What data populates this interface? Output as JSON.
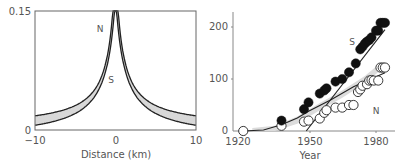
{
  "chart_data": [
    {
      "type": "line",
      "title": "",
      "xlabel": "Distance (km)",
      "ylabel": "",
      "xlim": [
        -10,
        10
      ],
      "ylim": [
        0,
        0.15
      ],
      "x_ticks": [
        "−10",
        "0",
        "10"
      ],
      "y_ticks": [
        "0",
        "0.15"
      ],
      "grid": false,
      "annotations": [
        {
          "text": "N",
          "x": -1.6,
          "y": 0.133
        },
        {
          "text": "S",
          "x": -1.4,
          "y": 0.075
        }
      ],
      "series": [
        {
          "name": "N",
          "description": "upper band edge, peaked curve centered at 0",
          "x": [
            -10,
            -7.5,
            -5,
            -3,
            -2,
            -1,
            -0.5,
            0,
            0.5,
            1,
            2,
            3,
            5,
            7.5,
            10
          ],
          "values": [
            0.015,
            0.024,
            0.037,
            0.058,
            0.075,
            0.105,
            0.13,
            0.15,
            0.13,
            0.105,
            0.075,
            0.058,
            0.037,
            0.024,
            0.015
          ]
        },
        {
          "name": "S",
          "description": "lower band edge, peaked curve centered at 0",
          "x": [
            -10,
            -7.5,
            -5,
            -3,
            -2,
            -1,
            -0.5,
            0,
            0.5,
            1,
            2,
            3,
            5,
            7.5,
            10
          ],
          "values": [
            0.007,
            0.015,
            0.03,
            0.052,
            0.072,
            0.105,
            0.13,
            0.15,
            0.13,
            0.105,
            0.072,
            0.052,
            0.03,
            0.015,
            0.007
          ]
        }
      ],
      "shaded_band": "grey band between N and S curves"
    },
    {
      "type": "scatter",
      "title": "",
      "xlabel": "Year",
      "ylabel": "",
      "xlim": [
        1912,
        1989
      ],
      "ylim": [
        0,
        230
      ],
      "x_ticks": [
        "1920",
        "1950",
        "1980"
      ],
      "y_ticks": [
        "0",
        "100",
        "200"
      ],
      "grid": false,
      "annotations": [
        {
          "text": "S",
          "x": 1964,
          "y": 152
        },
        {
          "text": "N",
          "x": 1979,
          "y": 40
        }
      ],
      "series": [
        {
          "name": "S",
          "marker": "filled-circle",
          "x": [
            1938,
            1948,
            1950,
            1955,
            1957,
            1958,
            1962,
            1965,
            1968,
            1971,
            1973,
            1974,
            1975,
            1976,
            1977,
            1978,
            1980,
            1981,
            1982,
            1983,
            1984
          ],
          "values": [
            20,
            42,
            55,
            72,
            78,
            82,
            95,
            100,
            113,
            130,
            157,
            162,
            168,
            172,
            175,
            180,
            193,
            193,
            208,
            208,
            208
          ]
        },
        {
          "name": "N",
          "marker": "open-circle",
          "x": [
            1921,
            1938,
            1948,
            1950,
            1955,
            1957,
            1958,
            1962,
            1965,
            1968,
            1970,
            1972,
            1973,
            1974,
            1976,
            1977,
            1978,
            1979,
            1981,
            1982,
            1983,
            1984
          ],
          "values": [
            0,
            10,
            18,
            20,
            24,
            35,
            40,
            45,
            45,
            50,
            50,
            75,
            80,
            87,
            90,
            97,
            98,
            97,
            97,
            122,
            122,
            122
          ]
        },
        {
          "name": "S-fit",
          "marker": "line",
          "x": [
            1949,
            1984
          ],
          "values": [
            0,
            195
          ]
        },
        {
          "name": "N-fit",
          "marker": "line",
          "x": [
            1921,
            1930,
            1938,
            1945,
            1950,
            1960,
            1970,
            1984
          ],
          "values": [
            0,
            2,
            12,
            25,
            38,
            60,
            85,
            112
          ]
        },
        {
          "name": "model-band",
          "marker": "shaded-band",
          "x": [
            1925,
            1935,
            1945,
            1955,
            1965,
            1975,
            1982
          ],
          "values": [
            0,
            4,
            22,
            48,
            72,
            100,
            125
          ]
        }
      ]
    }
  ]
}
